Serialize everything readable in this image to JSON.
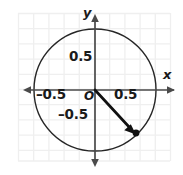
{
  "figure": {
    "type": "coordinate-plane-diagram",
    "width": 183,
    "height": 175,
    "background_color": "#ffffff",
    "grid": {
      "visible": true,
      "color": "#efefef",
      "spacing_px": 15.2,
      "left": 18,
      "top": 13,
      "right": 170,
      "bottom": 161
    },
    "axes": {
      "color": "#4a4a4a",
      "origin_px": {
        "x": 95,
        "y": 90
      },
      "x_axis": {
        "label": "x",
        "arrow_left": true,
        "arrow_right": true,
        "y_px": 90,
        "from_px": 22,
        "to_px": 177
      },
      "y_axis": {
        "label": "y",
        "arrow_up": true,
        "arrow_down": true,
        "x_px": 95,
        "from_px": 13,
        "to_px": 168
      }
    },
    "tick_labels": {
      "y_positive": "0.5",
      "y_negative": "–0.5",
      "x_positive": "0.5",
      "x_negative": "–0.5",
      "origin": "O"
    },
    "circle": {
      "name": "unit-circle",
      "center_px": {
        "x": 95,
        "y": 90
      },
      "radius_px": 61,
      "radius_units": 1,
      "stroke_color": "#262626",
      "stroke_width": 1.4,
      "fill": "none"
    },
    "ray": {
      "name": "terminal-ray",
      "from_px": {
        "x": 95,
        "y": 90
      },
      "to_px": {
        "x": 134,
        "y": 132
      },
      "stroke_color": "#111111",
      "stroke_width": 2.6,
      "arrowhead": true
    },
    "point": {
      "name": "terminal-point",
      "px": {
        "x": 136,
        "y": 133
      },
      "radius_px": 3.4,
      "color": "#111111"
    }
  }
}
